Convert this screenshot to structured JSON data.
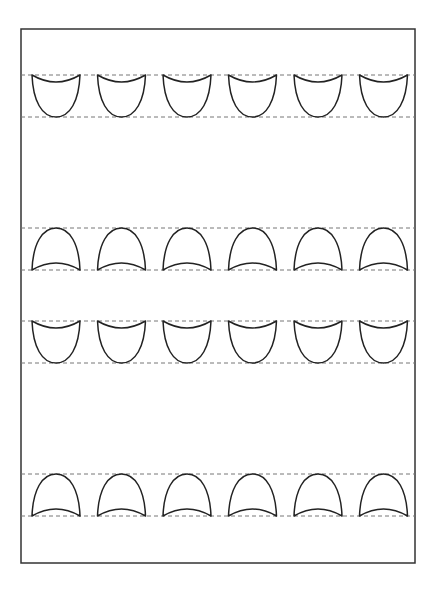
{
  "worksheet": {
    "type": "tracing-practice",
    "border": {
      "x": 21,
      "y": 29,
      "width": 394,
      "height": 534,
      "color": "#333333"
    },
    "guide_line_color": "#777777",
    "stroke_color": "#222222",
    "shape_columns_x": [
      32,
      97.5,
      163,
      228.5,
      294,
      359.5
    ],
    "shape_width": 48,
    "rows": [
      {
        "shape": "cup",
        "top_y": 75,
        "bottom_y": 117
      },
      {
        "shape": "arch",
        "top_y": 228,
        "bottom_y": 270
      },
      {
        "shape": "cup",
        "top_y": 321,
        "bottom_y": 363
      },
      {
        "shape": "arch",
        "top_y": 474,
        "bottom_y": 516
      }
    ]
  }
}
